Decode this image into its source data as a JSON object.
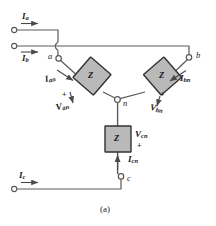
{
  "figure": {
    "caption": "(a)",
    "impedance_label": "Z",
    "colors": {
      "wire": "#5a5a5a",
      "block_fill": "#b9b9b9",
      "block_stroke": "#333333",
      "text": "#1a1a1a",
      "background": "#ffffff"
    }
  },
  "line_currents": [
    {
      "id": "Ia",
      "symbol": "I",
      "subscript": "a",
      "direction": "right"
    },
    {
      "id": "Ib",
      "symbol": "I",
      "subscript": "b",
      "direction": "right"
    },
    {
      "id": "Ic",
      "symbol": "I",
      "subscript": "c",
      "direction": "right"
    }
  ],
  "phase_currents": [
    {
      "id": "Ian",
      "symbol": "I",
      "subscript": "an",
      "direction": "down-right"
    },
    {
      "id": "Ibn",
      "symbol": "I",
      "subscript": "bn",
      "direction": "down-left"
    },
    {
      "id": "Icn",
      "symbol": "I",
      "subscript": "cn",
      "direction": "up"
    }
  ],
  "phase_voltages": [
    {
      "id": "Van",
      "symbol": "V",
      "subscript": "an",
      "polarity": "+"
    },
    {
      "id": "Vbn",
      "symbol": "V",
      "subscript": "bn",
      "polarity": "+"
    },
    {
      "id": "Vcn",
      "symbol": "V",
      "subscript": "cn",
      "polarity": "+"
    }
  ],
  "terminals": [
    {
      "id": "a",
      "label": "a"
    },
    {
      "id": "b",
      "label": "b"
    },
    {
      "id": "c",
      "label": "c"
    },
    {
      "id": "n",
      "label": "n"
    }
  ],
  "impedances": [
    {
      "id": "Za",
      "label": "Z",
      "phase": "a"
    },
    {
      "id": "Zb",
      "label": "Z",
      "phase": "b"
    },
    {
      "id": "Zc",
      "label": "Z",
      "phase": "c"
    }
  ]
}
